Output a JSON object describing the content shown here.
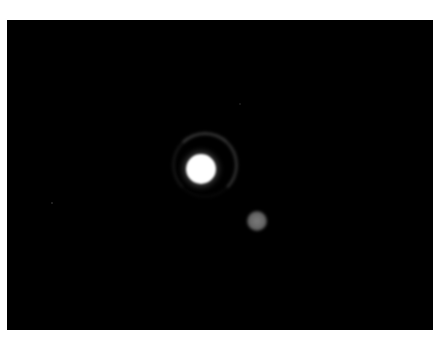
{
  "image": {
    "description": "Telescope image of a bright planet with faint surrounding ring arc and a dimmer companion moon against black sky",
    "background_color": "#000000",
    "frame_color": "#ffffff"
  },
  "objects": {
    "planet": {
      "center_x": 201,
      "center_y": 169,
      "radius": 15,
      "color": "#ffffff"
    },
    "ring": {
      "center_x": 205,
      "center_y": 165,
      "radius": 33,
      "color": "#5a5a5a"
    },
    "moon": {
      "center_x": 257,
      "center_y": 221,
      "radius": 10,
      "color": "#6e6e6e"
    },
    "faint_stars": [
      {
        "x": 51,
        "y": 202
      },
      {
        "x": 239,
        "y": 103
      }
    ]
  }
}
